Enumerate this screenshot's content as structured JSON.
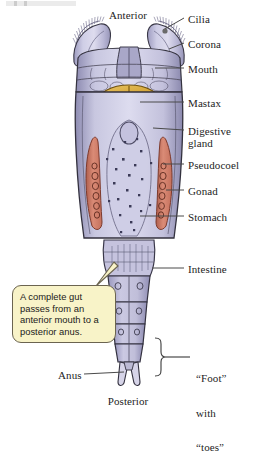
{
  "figure": {
    "organism": "rotifer"
  },
  "orientation": {
    "anterior": "Anterior",
    "posterior": "Posterior"
  },
  "labels": [
    {
      "id": "cilia",
      "text": "Cilia",
      "x": 188,
      "y": 14
    },
    {
      "id": "corona",
      "text": "Corona",
      "x": 188,
      "y": 39
    },
    {
      "id": "mouth",
      "text": "Mouth",
      "x": 188,
      "y": 64
    },
    {
      "id": "mastax",
      "text": "Mastax",
      "x": 188,
      "y": 98
    },
    {
      "id": "digestive-gland",
      "text": "Digestive\ngland",
      "x": 188,
      "y": 126
    },
    {
      "id": "pseudocoel",
      "text": "Pseudocoel",
      "x": 188,
      "y": 160
    },
    {
      "id": "gonad",
      "text": "Gonad",
      "x": 188,
      "y": 186
    },
    {
      "id": "stomach",
      "text": "Stomach",
      "x": 188,
      "y": 212
    },
    {
      "id": "intestine",
      "text": "Intestine",
      "x": 188,
      "y": 264
    },
    {
      "id": "anus",
      "text": "Anus",
      "x": 58,
      "y": 370
    }
  ],
  "bracket_label": {
    "id": "foot-with-toes",
    "lines": [
      "“Foot”",
      "with",
      "“toes”"
    ],
    "x": 196,
    "y": 350
  },
  "callout": {
    "text": "A complete gut passes from an anterior mouth to a posterior anus.",
    "fill": "#f8f3c8",
    "border": "#6b6450"
  },
  "colors": {
    "body": "#b9b8d8",
    "body_light": "#d3d2e6",
    "mastax": "#d9a838",
    "mastax_dark": "#b0801f",
    "digestive_gland": "#7a4f63",
    "gonad": "#cf7f6e",
    "gonad_dark": "#a85a4b",
    "outline": "#2b2b33",
    "cilia": "#8d8aa6",
    "speckle": "#3b3a57",
    "leader": "#4a4a4a",
    "background": "#ffffff"
  }
}
